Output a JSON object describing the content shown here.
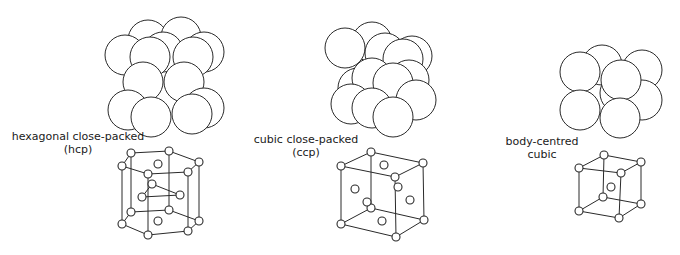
{
  "structures": [
    {
      "id": "hcp",
      "label_line1": "hexagonal close-packed",
      "label_line2": "(hcp)"
    },
    {
      "id": "ccp",
      "label_line1": "cubic close-packed",
      "label_line2": "(ccp)"
    },
    {
      "id": "bcc",
      "label_line1": "body-centred",
      "label_line2": "cubic"
    }
  ],
  "colors": {
    "line": "#2a2a2a",
    "fill": "#ffffff",
    "text": "#1a1a1a"
  }
}
